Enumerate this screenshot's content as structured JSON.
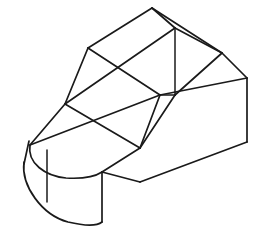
{
  "document": {
    "title": "Isometric Part Drawing",
    "type": "line-drawing",
    "subject": "3d-mechanical-part-wireframe",
    "background_color": "#ffffff",
    "line_color": "#1a1a1a",
    "line_width": 1.7,
    "canvas": {
      "width": 258,
      "height": 248
    }
  },
  "geometry": {
    "projection": "isometric",
    "description": "Block with rounded semicircular left end, flat base slab, and an angled wedge prism rising to an apex at the top",
    "paths": {
      "base_top_left_edge": "M 65 104 L 140 148",
      "base_top_front_edge": "M 140 148 L 102 172",
      "base_front_lower_edge": "M 102 172 L 140 182",
      "base_right_long_edge": "M 140 182 L 247 142",
      "base_right_vertical": "M 247 78 L 247 142",
      "base_upper_right_edge": "M 160 95 L 247 78",
      "base_top_rear_edge": "M 65 104 L 160 95",
      "mid_cross_edge_a": "M 65 104 L 175 28",
      "mid_cross_edge_b": "M 30 145 L 160 95",
      "arc_top_outer": "M 65 104 L 30 145",
      "arc_top_ellipse": "M 30 145 A 34 40 0 0 0 102 172",
      "arc_bottom_ellipse": "M 24 175 A 38 44 0 0 0 102 222",
      "arc_left_vertical": "M 24 160 L 24 175",
      "arc_seam_vertical": "M 47 152 L 47 202",
      "arc_right_vertical": "M 102 172 L 102 222",
      "wedge_left_edge": "M 65 104 L 88 48",
      "wedge_left_top_edge": "M 88 48 L 152 8",
      "wedge_apex_right_edge": "M 152 8 L 222 53",
      "wedge_apex_lower_edge": "M 152 8 L 175 28",
      "wedge_ridge_front": "M 175 28 L 222 53",
      "wedge_right_vertical": "M 175 28 L 175 95",
      "wedge_right_corner": "M 222 53 L 247 78",
      "wedge_face_diagonal": "M 88 48 L 160 95",
      "wedge_inner_edge": "M 175 95 L 160 95",
      "wedge_front_slope": "M 175 95 L 140 148",
      "wedge_left_slope": "M 160 95 L 140 148",
      "wedge_base_fold": "M 175 95 L 222 53"
    },
    "vertices": [
      {
        "name": "apex-top",
        "x": 152,
        "y": 8
      },
      {
        "name": "wedge-left-shoulder",
        "x": 88,
        "y": 48
      },
      {
        "name": "wedge-ridge-front",
        "x": 175,
        "y": 28
      },
      {
        "name": "wedge-right-shoulder",
        "x": 222,
        "y": 53
      },
      {
        "name": "base-right-top",
        "x": 247,
        "y": 78
      },
      {
        "name": "base-right-bottom",
        "x": 247,
        "y": 142
      },
      {
        "name": "wedge-inner-junction",
        "x": 160,
        "y": 95
      },
      {
        "name": "wedge-right-foot",
        "x": 175,
        "y": 95
      },
      {
        "name": "base-top-left",
        "x": 65,
        "y": 104
      },
      {
        "name": "base-front-mid",
        "x": 140,
        "y": 148
      },
      {
        "name": "base-front-left",
        "x": 102,
        "y": 172
      },
      {
        "name": "base-front-lower",
        "x": 140,
        "y": 182
      },
      {
        "name": "arc-top-left",
        "x": 30,
        "y": 145
      },
      {
        "name": "arc-bottom-left",
        "x": 24,
        "y": 175
      },
      {
        "name": "arc-front-bottom",
        "x": 102,
        "y": 222
      }
    ]
  }
}
